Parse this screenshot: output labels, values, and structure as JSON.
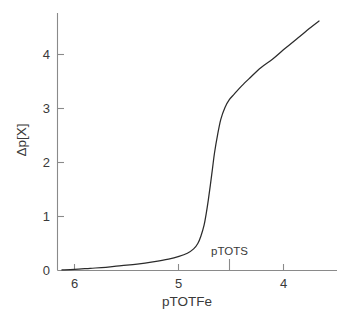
{
  "chart_data": {
    "type": "line",
    "title": "",
    "subtitle": "",
    "xlabel": "pTOTFe",
    "ylabel": "Δp[X]",
    "x_tick_labels": [
      "6",
      "5",
      "4"
    ],
    "x_tick_values": [
      6,
      5,
      4
    ],
    "y_tick_labels": [
      "0",
      "1",
      "2",
      "3",
      "4"
    ],
    "y_tick_values": [
      0,
      1,
      2,
      3,
      4
    ],
    "xlim": [
      6.25,
      3.6
    ],
    "ylim": [
      0,
      4.85
    ],
    "x_axis_direction": "decreasing",
    "grid": false,
    "legend": null,
    "annotations": [
      {
        "text": "pTOTS",
        "x": 4.67,
        "y": 0.42,
        "marker": "tick-below-axis"
      }
    ],
    "series": [
      {
        "name": "Δp[X] titration curve",
        "x": [
          6.12,
          6.0,
          5.85,
          5.7,
          5.55,
          5.4,
          5.25,
          5.1,
          5.0,
          4.92,
          4.86,
          4.82,
          4.79,
          4.76,
          4.74,
          4.72,
          4.7,
          4.68,
          4.66,
          4.63,
          4.6,
          4.56,
          4.52,
          4.47,
          4.4,
          4.32,
          4.22,
          4.1,
          3.98,
          3.86,
          3.74,
          3.66
        ],
        "y": [
          0.01,
          0.02,
          0.04,
          0.06,
          0.09,
          0.12,
          0.16,
          0.21,
          0.26,
          0.32,
          0.4,
          0.5,
          0.64,
          0.84,
          1.05,
          1.3,
          1.58,
          1.88,
          2.18,
          2.52,
          2.8,
          3.02,
          3.16,
          3.27,
          3.42,
          3.57,
          3.75,
          3.92,
          4.12,
          4.31,
          4.5,
          4.62
        ]
      }
    ]
  }
}
